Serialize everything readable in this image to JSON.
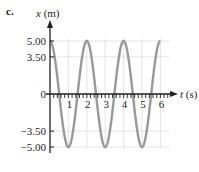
{
  "panel_label": "c.",
  "chart_data": {
    "type": "line",
    "title": "",
    "xlabel": "t (s)",
    "ylabel": "x (m)",
    "xlabel_var": "t",
    "xlabel_unit": "(s)",
    "ylabel_var": "x",
    "ylabel_unit": "(m)",
    "x_ticks": [
      "1",
      "2",
      "3",
      "4",
      "5",
      "6"
    ],
    "y_ticks": [
      "5.00",
      "3.50",
      "0",
      "-3.50",
      "-5.00"
    ],
    "xlim": [
      0,
      6.4
    ],
    "ylim": [
      -5.0,
      5.0
    ],
    "grid": true,
    "legend": "none",
    "series": [
      {
        "name": "x(t) = 5.00 cos(πt)",
        "color": "#999999",
        "x": [
          0,
          0.5,
          1,
          1.5,
          2,
          2.5,
          3,
          3.5,
          4,
          4.5,
          5,
          5.5,
          6
        ],
        "y": [
          5.0,
          0,
          -5.0,
          0,
          5.0,
          0,
          -5.0,
          0,
          5.0,
          0,
          -5.0,
          0,
          5.0
        ]
      }
    ],
    "amplitude": 5.0,
    "period": 2
  }
}
